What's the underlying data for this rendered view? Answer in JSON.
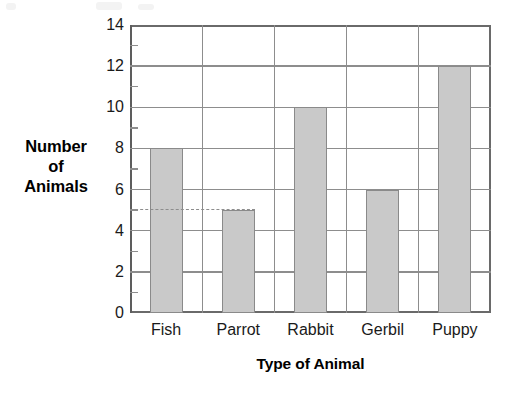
{
  "chart_data": {
    "type": "bar",
    "title": "",
    "categories": [
      "Fish",
      "Parrot",
      "Rabbit",
      "Gerbil",
      "Puppy"
    ],
    "values": [
      8,
      5,
      10,
      6,
      12
    ],
    "xlabel": "Type of Animal",
    "ylabel": "Number of Animals",
    "ylim": [
      0,
      14
    ],
    "y_major_ticks": [
      0,
      2,
      4,
      6,
      8,
      10,
      12,
      14
    ],
    "y_minor_ticks": [
      1,
      3,
      5,
      7,
      9,
      11,
      13
    ],
    "y_tick_labels": [
      "0",
      "2",
      "4",
      "6",
      "8",
      "10",
      "12",
      "14"
    ],
    "grid": "horizontal-and-vertical",
    "legend": "none",
    "annotations": [
      {
        "type": "dashed-reference-line",
        "value": 5,
        "label": "",
        "from_category": "Fish",
        "to_category": "Parrot",
        "description": "dashed line at 5 from y-axis to top of Parrot bar"
      }
    ],
    "bar_color": "#c9c9c9",
    "bar_border_color": "#8a8a8a",
    "grid_color": "#8d8d8d",
    "axis_color": "#5d5d5d",
    "text_color": "#1a1a1a"
  },
  "axis_titles": {
    "y_line1": "Number",
    "y_line2": "of",
    "y_line3": "Animals",
    "x": "Type of Animal"
  }
}
